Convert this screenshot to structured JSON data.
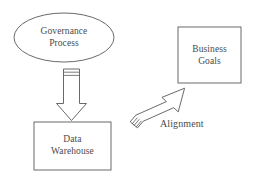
{
  "diagram": {
    "type": "flow-diagram",
    "background_color": "#ffffff",
    "stroke_color": "#595959",
    "text_color": "#4a4a4a",
    "nodes": [
      {
        "id": "governance-process",
        "shape": "ellipse",
        "label_line1": "Governance",
        "label_line2": "Process",
        "x": 14,
        "y": 13,
        "width": 100,
        "height": 49
      },
      {
        "id": "business-goals",
        "shape": "rectangle",
        "label_line1": "Business",
        "label_line2": "Goals",
        "x": 178,
        "y": 27,
        "width": 63,
        "height": 56
      },
      {
        "id": "data-warehouse",
        "shape": "rectangle",
        "label_line1": "Data",
        "label_line2": "Warehouse",
        "x": 34,
        "y": 122,
        "width": 77,
        "height": 48
      }
    ],
    "arrows": [
      {
        "id": "governance-to-warehouse",
        "style": "block-arrow",
        "direction": "down",
        "from": "governance-process",
        "to": "data-warehouse",
        "label": ""
      },
      {
        "id": "alignment-arrow",
        "style": "block-arrow",
        "direction": "up-right",
        "from": "data-warehouse",
        "to": "business-goals",
        "label": "Alignment"
      }
    ]
  }
}
